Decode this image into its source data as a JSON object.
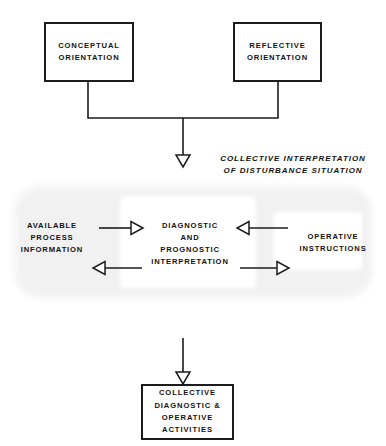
{
  "diagram": {
    "colors": {
      "stroke": "#1c1c1c",
      "text": "#121212",
      "background": "#ffffff",
      "blob_fill": "#f1f1f1"
    },
    "nodes": {
      "conceptual_orientation": "CONCEPTUAL\nORIENTATION",
      "reflective_orientation": "REFLECTIVE\nORIENTATION",
      "available_process_information": "AVAILABLE\nPROCESS\nINFORMATION",
      "diagnostic_prognostic_interpretation": "DIAGNOSTIC\nAND\nPROGNOSTIC\nINTERPRETATION",
      "operative_instructions": "OPERATIVE\nINSTRUCTIONS",
      "collective_activities": "COLLECTIVE\nDIAGNOSTIC &\nOPERATIVE\nACTIVITIES"
    },
    "annotations": {
      "collective_interpretation": "COLLECTIVE INTERPRETATION\nOF DISTURBANCE SITUATION"
    },
    "connectors": {
      "orientation_join": "merge-line",
      "down_to_interpretation": "open-arrow-down",
      "info_to_interpretation": "open-arrow-right",
      "interpretation_to_info": "open-arrow-left",
      "instructions_to_interpretation": "open-arrow-left",
      "interpretation_to_instructions": "open-arrow-right",
      "down_to_activities": "open-arrow-down"
    }
  }
}
